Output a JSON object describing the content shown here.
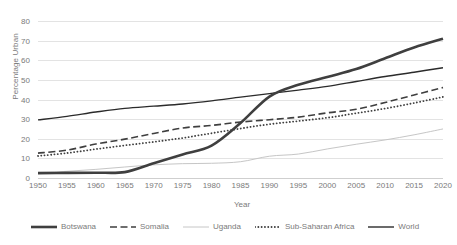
{
  "chart_data": {
    "type": "line",
    "title": "",
    "xlabel": "Year",
    "ylabel": "Percentage Urban",
    "xlim": [
      1950,
      2020
    ],
    "ylim": [
      0,
      80
    ],
    "ytick_step": 10,
    "xtick_step": 5,
    "grid": true,
    "legend_position": "bottom",
    "x": [
      1950,
      1955,
      1960,
      1965,
      1970,
      1975,
      1980,
      1985,
      1990,
      1995,
      2000,
      2005,
      2010,
      2015,
      2020
    ],
    "xtick_labels": [
      "1950",
      "1955",
      "1960",
      "1965",
      "1970",
      "1975",
      "1980",
      "1985",
      "1990",
      "1995",
      "2000",
      "2005",
      "2010",
      "2015",
      "2020"
    ],
    "ytick_labels": [
      "0",
      "10",
      "20",
      "30",
      "40",
      "50",
      "60",
      "70",
      "80"
    ],
    "series": [
      {
        "name": "Botswana",
        "style": "solid-thick",
        "color": "#3f3f3f",
        "values": [
          2.5,
          2.6,
          2.7,
          3.0,
          7.5,
          12.0,
          16.5,
          28.0,
          41.5,
          47.5,
          51.5,
          55.5,
          61.0,
          66.5,
          71.0
        ]
      },
      {
        "name": "Somalia",
        "style": "dashed",
        "color": "#3f3f3f",
        "values": [
          12.7,
          14.2,
          17.3,
          19.8,
          22.7,
          25.5,
          26.8,
          28.5,
          29.7,
          31.0,
          33.2,
          35.0,
          38.5,
          42.3,
          46.1
        ]
      },
      {
        "name": "Uganda",
        "style": "solid-thin-light",
        "color": "#c6c6c6",
        "values": [
          2.8,
          3.4,
          4.4,
          5.6,
          6.7,
          7.3,
          7.5,
          8.3,
          11.1,
          12.2,
          14.8,
          17.2,
          19.4,
          22.0,
          25.0
        ]
      },
      {
        "name": "Sub-Saharan Africa",
        "style": "dotted",
        "color": "#3f3f3f",
        "values": [
          11.2,
          12.7,
          14.7,
          16.6,
          18.4,
          20.4,
          22.8,
          25.2,
          27.4,
          29.0,
          30.7,
          33.0,
          35.4,
          38.2,
          41.3
        ]
      },
      {
        "name": "World",
        "style": "solid-medium",
        "color": "#2b2b2b",
        "values": [
          29.6,
          31.4,
          33.6,
          35.5,
          36.6,
          37.7,
          39.3,
          41.2,
          43.0,
          44.8,
          46.7,
          49.2,
          51.7,
          53.9,
          56.2
        ]
      }
    ]
  },
  "legend": {
    "items": [
      {
        "label": "Botswana"
      },
      {
        "label": "Somalia"
      },
      {
        "label": "Uganda"
      },
      {
        "label": "Sub-Saharan Africa"
      },
      {
        "label": "World"
      }
    ]
  }
}
